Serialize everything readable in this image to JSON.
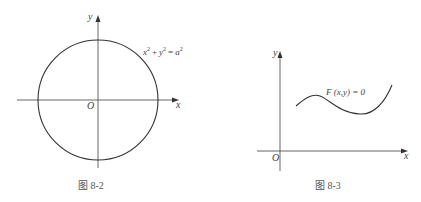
{
  "figures": [
    {
      "caption": "图  8-2",
      "x_axis_label": "x",
      "y_axis_label": "y",
      "origin_label": "O",
      "equation": {
        "base_x": "x",
        "base_y": "y",
        "base_a": "a",
        "exp": "2",
        "plus": "+",
        "equals": "="
      },
      "shape": "circle centered at origin"
    },
    {
      "caption": "图  8-3",
      "x_axis_label": "x",
      "y_axis_label": "y",
      "origin_label": "O",
      "equation_label": "F (x,y) = 0",
      "shape": "smooth curve in first quadrant"
    }
  ]
}
